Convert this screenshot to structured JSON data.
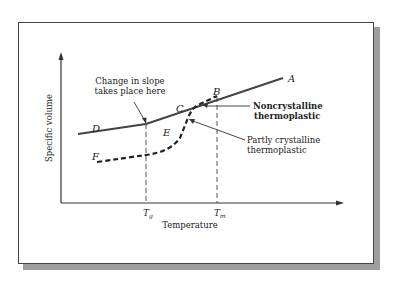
{
  "figure": {
    "y_axis_label": "Specific volume",
    "x_axis_label": "Temperature",
    "tick_labels": {
      "tg": {
        "main": "T",
        "sub": "g"
      },
      "tm": {
        "main": "T",
        "sub": "m"
      }
    },
    "point_labels": {
      "A": "A",
      "B": "B",
      "C": "C",
      "D": "D",
      "E": "E",
      "F": "F"
    },
    "annotations": {
      "slope_change": [
        "Change in slope",
        "takes place here"
      ],
      "noncrystalline": [
        "Noncrystalline",
        "thermoplastic"
      ],
      "partly_crystalline": [
        "Partly crystalline",
        "thermoplastic"
      ]
    },
    "curves": [
      {
        "name": "Noncrystalline thermoplastic",
        "style": "solid",
        "path": "D-C-A"
      },
      {
        "name": "Partly crystalline thermoplastic",
        "style": "dashed",
        "path": "F-E-B"
      }
    ],
    "colors": {
      "line": "#444444",
      "shadow": "#9e9e9e",
      "text": "#222222"
    }
  }
}
